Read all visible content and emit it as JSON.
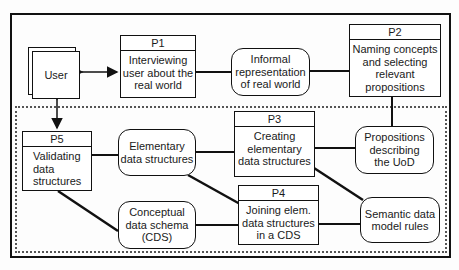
{
  "diagram": {
    "external_entity": {
      "label": "User"
    },
    "processes": [
      {
        "id": "P1",
        "label": "Interviewing user about the real world",
        "lines": [
          "Interviewing",
          "user about the",
          "real  world"
        ]
      },
      {
        "id": "P2",
        "label": "Naming concepts and selecting relevant propositions",
        "lines": [
          "Naming concepts",
          "and selecting",
          "relevant",
          "propositions"
        ]
      },
      {
        "id": "P3",
        "label": "Creating elementary data structures",
        "lines": [
          "Creating",
          "elementary",
          "data  structures"
        ]
      },
      {
        "id": "P4",
        "label": "Joining elem. data structures in a CDS",
        "lines": [
          "Joining elem.",
          "data  structures",
          "in a CDS"
        ]
      },
      {
        "id": "P5",
        "label": "Validating data structures",
        "lines": [
          "Validating",
          "data",
          "structures"
        ]
      }
    ],
    "stores": [
      {
        "id": "informal",
        "lines": [
          "Informal",
          "representation",
          "of real  world"
        ]
      },
      {
        "id": "propositions",
        "lines": [
          "Propositions",
          "describing",
          "the UoD"
        ]
      },
      {
        "id": "elementary",
        "lines": [
          "Elementary",
          "data  structures"
        ]
      },
      {
        "id": "cds",
        "lines": [
          "Conceptual",
          "data schema",
          "(CDS)"
        ]
      },
      {
        "id": "semantic",
        "lines": [
          "Semantic data",
          "model  rules"
        ]
      }
    ]
  }
}
